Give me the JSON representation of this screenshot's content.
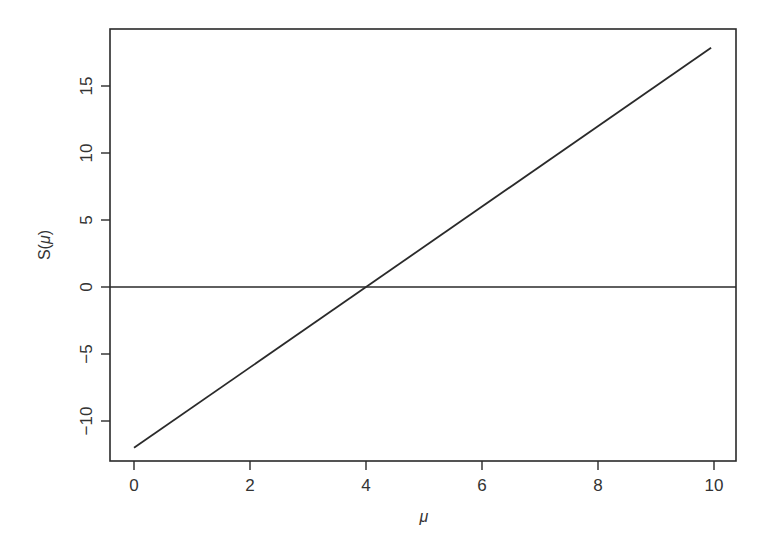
{
  "chart_data": {
    "type": "line",
    "title": "",
    "xlabel": "μ",
    "ylabel": "S(μ)",
    "xlim": [
      -0.4,
      10.4
    ],
    "ylim": [
      -13.2,
      19.2
    ],
    "grid": false,
    "legend": null,
    "x_ticks": [
      0,
      2,
      4,
      6,
      8,
      10
    ],
    "y_ticks": [
      -10,
      -5,
      0,
      5,
      10,
      15
    ],
    "x_tick_labels": [
      "0",
      "2",
      "4",
      "6",
      "8",
      "10"
    ],
    "y_tick_labels": [
      "−10",
      "−5",
      "0",
      "5",
      "10",
      "15"
    ],
    "series": [
      {
        "name": "S(μ)",
        "x": [
          0,
          9.95
        ],
        "values": [
          -12,
          17.85
        ],
        "color": "#2a2a2a"
      }
    ],
    "reference_lines": [
      {
        "type": "horizontal",
        "y": 0,
        "color": "#2a2a2a"
      }
    ],
    "annotations": [
      "Line crosses zero at μ = 4"
    ]
  },
  "labels": {
    "xlabel": "μ",
    "ylabel_prefix": "S(",
    "ylabel_var": "μ",
    "ylabel_suffix": ")"
  },
  "colors": {
    "axis": "#2a2a2a",
    "line": "#2a2a2a",
    "background": "#ffffff"
  }
}
